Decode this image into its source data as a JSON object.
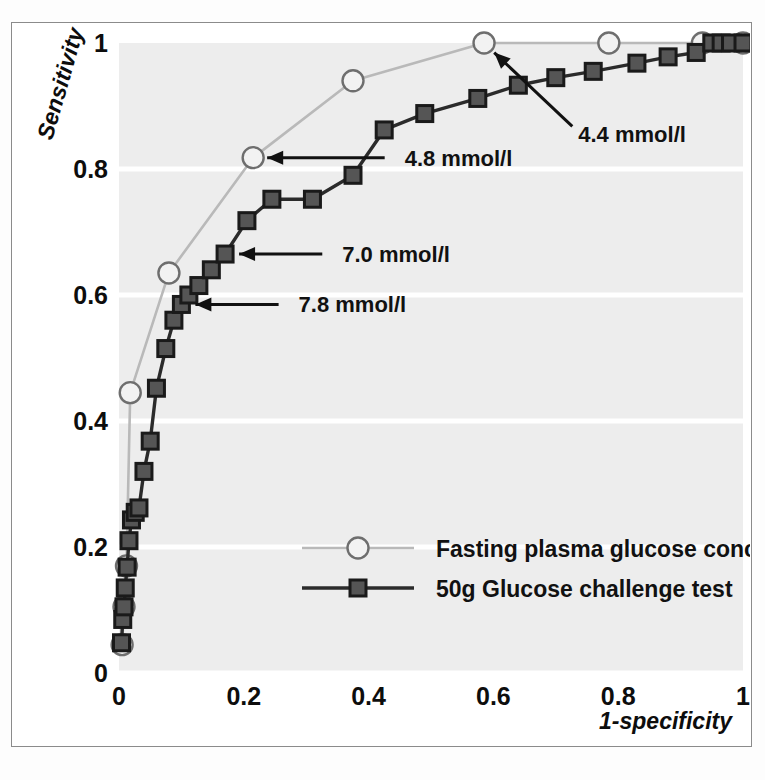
{
  "figure": {
    "kind": "roc-curve-figure",
    "background_color": "#ffffff",
    "plot_background_color": "#ededed",
    "gridline_color": "#ffffff",
    "frame_color": "#8b8b8b"
  },
  "chart_data": {
    "type": "line",
    "title": "",
    "xlabel": "1-specificity",
    "ylabel": "Sensitivity",
    "xlim": [
      0,
      1
    ],
    "ylim": [
      0,
      1
    ],
    "xticks": [
      "0",
      "0.2",
      "0.4",
      "0.6",
      "0.8",
      "1"
    ],
    "xtick_values": [
      0,
      0.2,
      0.4,
      0.6,
      0.8,
      1
    ],
    "yticks": [
      "0",
      "0.2",
      "0.4",
      "0.6",
      "0.8",
      "1"
    ],
    "ytick_values": [
      0,
      0.2,
      0.4,
      0.6,
      0.8,
      1
    ],
    "grid": "horizontal-white-gridlines",
    "legend_position": "inside-bottom-right",
    "series": [
      {
        "name": "Fasting plasma glucose concentration",
        "marker": "open-circle",
        "color": "#b9b9b9",
        "marker_edge_color": "#6e6e6e",
        "marker_face_color": "#f2f2f2",
        "x": [
          0.005,
          0.008,
          0.012,
          0.018,
          0.08,
          0.215,
          0.375,
          0.585,
          0.785,
          0.935,
          1.0
        ],
        "y": [
          0.045,
          0.105,
          0.17,
          0.445,
          0.635,
          0.818,
          0.94,
          1.0,
          1.0,
          1.0,
          1.0
        ]
      },
      {
        "name": "50g Glucose challenge test",
        "marker": "filled-square",
        "color": "#2b2b2b",
        "marker_edge_color": "#1a1a1a",
        "marker_face_color": "#555555",
        "x": [
          0.004,
          0.006,
          0.008,
          0.01,
          0.013,
          0.016,
          0.02,
          0.026,
          0.032,
          0.04,
          0.05,
          0.06,
          0.075,
          0.088,
          0.1,
          0.112,
          0.128,
          0.148,
          0.17,
          0.205,
          0.245,
          0.31,
          0.375,
          0.425,
          0.49,
          0.575,
          0.64,
          0.7,
          0.76,
          0.83,
          0.88,
          0.925,
          0.95,
          0.965,
          0.98,
          1.0
        ],
        "y": [
          0.048,
          0.085,
          0.105,
          0.135,
          0.168,
          0.21,
          0.243,
          0.255,
          0.262,
          0.32,
          0.368,
          0.452,
          0.515,
          0.56,
          0.585,
          0.6,
          0.615,
          0.64,
          0.665,
          0.718,
          0.752,
          0.752,
          0.79,
          0.862,
          0.888,
          0.912,
          0.933,
          0.945,
          0.955,
          0.968,
          0.978,
          0.985,
          1.0,
          1.0,
          1.0,
          1.0
        ]
      }
    ],
    "annotations": [
      {
        "label": "4.4 mmol/l",
        "points_to_series": "Fasting plasma glucose concentration",
        "target": [
          0.585,
          1.0
        ],
        "text_x": 0.72,
        "text_y": 0.855
      },
      {
        "label": "4.8 mmol/l",
        "points_to_series": "Fasting plasma glucose concentration",
        "target": [
          0.215,
          0.818
        ],
        "text_x": 0.445,
        "text_y": 0.818
      },
      {
        "label": "7.0 mmol/l",
        "points_to_series": "50g Glucose challenge test",
        "target": [
          0.17,
          0.665
        ],
        "text_x": 0.345,
        "text_y": 0.665
      },
      {
        "label": "7.8 mmol/l",
        "points_to_series": "50g Glucose challenge test",
        "target": [
          0.1,
          0.585
        ],
        "text_x": 0.275,
        "text_y": 0.585
      }
    ],
    "legend_entries": [
      {
        "label": "Fasting plasma glucose concentration",
        "marker": "open-circle",
        "color": "#b9b9b9"
      },
      {
        "label": "50g Glucose challenge test",
        "marker": "filled-square",
        "color": "#2b2b2b"
      }
    ]
  }
}
